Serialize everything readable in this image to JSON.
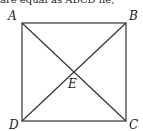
{
  "caption_fragment": "are equal as ABCD lie, ",
  "figure": {
    "shape": "square",
    "labels": {
      "A": "A",
      "B": "B",
      "C": "C",
      "D": "D",
      "E": "E"
    },
    "stroke_color": "#333333"
  }
}
